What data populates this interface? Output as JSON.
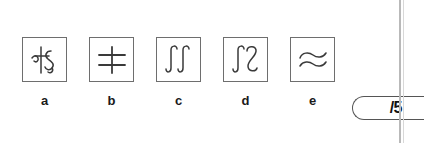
{
  "worksheet": {
    "kind": "multiple-choice-symbol-row",
    "choices": [
      {
        "label": "a",
        "glyph_name": "crossed-vertical-with-s-curve-glyph",
        "description": "vertical stroke with short horizontal crossbar and an overlapping S curve"
      },
      {
        "label": "b",
        "glyph_name": "vertical-with-two-horizontal-bars-glyph",
        "description": "single vertical line crossed by two horizontal lines"
      },
      {
        "label": "c",
        "glyph_name": "double-integral-glyph",
        "description": "two integral signs side by side, same orientation"
      },
      {
        "label": "d",
        "glyph_name": "integral-and-mirrored-integral-glyph",
        "description": "an integral sign followed by a mirrored integral sign"
      },
      {
        "label": "e",
        "glyph_name": "two-horizontal-wave-lines-glyph",
        "description": "two stacked horizontal wavy S lines"
      }
    ]
  },
  "score": {
    "value": "",
    "placeholder": "",
    "denominator": "/5"
  },
  "colors": {
    "box_border": "#6e6e6e",
    "ink": "#3a3a3a",
    "label_text": "#1a1a1a",
    "page_rule": "#b9b9b9",
    "background": "#ffffff"
  }
}
